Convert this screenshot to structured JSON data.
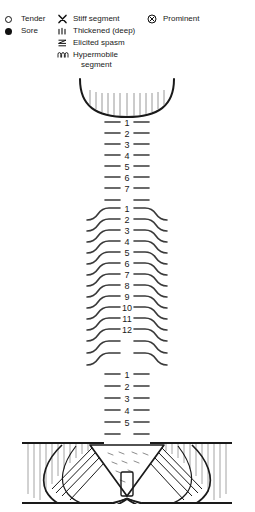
{
  "legend": {
    "columns": [
      {
        "id": "col-1",
        "items": [
          {
            "symbol": "circle-open-icon",
            "label": "Tender"
          },
          {
            "symbol": "circle-filled-icon",
            "label": "Sore"
          }
        ]
      },
      {
        "id": "col-2",
        "items": [
          {
            "symbol": "x-mark-icon",
            "label": "Stiff segment"
          },
          {
            "symbol": "triple-tick-icon",
            "label": "Thickened (deep)"
          },
          {
            "symbol": "zigzag-icon",
            "label": "Elicited spasm"
          },
          {
            "symbol": "wavy-icon",
            "label": "Hypermobile",
            "label_sub": "segment"
          }
        ]
      },
      {
        "id": "col-3",
        "items": [
          {
            "symbol": "circle-cross-icon",
            "label": "Prominent"
          }
        ]
      }
    ]
  },
  "spine": {
    "title": "Spinal examination chart",
    "regions": [
      {
        "name": "cervical",
        "abbrev": "C",
        "count": 7,
        "labels": [
          "1",
          "2",
          "3",
          "4",
          "5",
          "6",
          "7"
        ],
        "style": "straight-bar"
      },
      {
        "name": "thoracic",
        "abbrev": "T",
        "count": 12,
        "labels": [
          "1",
          "2",
          "3",
          "4",
          "5",
          "6",
          "7",
          "8",
          "9",
          "10",
          "11",
          "12"
        ],
        "style": "rib-curve"
      },
      {
        "name": "lumbar",
        "abbrev": "L",
        "count": 5,
        "labels": [
          "1",
          "2",
          "3",
          "4",
          "5"
        ],
        "style": "straight-bar"
      },
      {
        "name": "pelvis",
        "abbrev": "S",
        "count": 0,
        "labels": [],
        "style": "sacrum-ilium"
      }
    ],
    "skull_base": "occiput-curve"
  },
  "colors": {
    "ink": "#1a1a1a",
    "line": "#3a3a3a",
    "hatch": "#8d8d8d",
    "background": "#ffffff",
    "faint": "#bdbdbd"
  },
  "footer": {
    "note": ""
  }
}
